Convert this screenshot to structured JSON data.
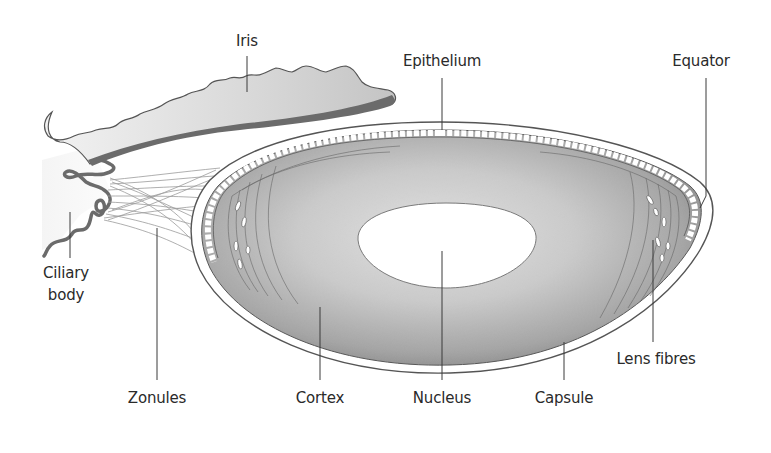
{
  "diagram": {
    "colors": {
      "background": "#ffffff",
      "iris_fill": "#cfcfcf",
      "iris_pigment": "#6b6b6b",
      "ciliary_body": "#6b6b6b",
      "cortex_outer": "#8e8e8e",
      "cortex_inner": "#d6d6d6",
      "nucleus_fill": "#ffffff",
      "capsule_line": "#555555",
      "zonule_lines": "#9a9a9a",
      "label_text": "#2a2a2a"
    },
    "labels": {
      "iris": "Iris",
      "epithelium": "Epithelium",
      "equator": "Equator",
      "ciliary_body_line1": "Ciliary",
      "ciliary_body_line2": "body",
      "lens_fibres": "Lens fibres",
      "zonules": "Zonules",
      "cortex": "Cortex",
      "nucleus": "Nucleus",
      "capsule": "Capsule"
    }
  }
}
